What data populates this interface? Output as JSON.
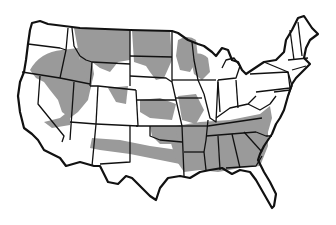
{
  "map": {
    "subject": "Contiguous United States",
    "style": "black-and-white outline map with gray shaded distribution regions",
    "colors": {
      "background": "#ffffff",
      "shade": "#9a9a9a",
      "outline": "#111111"
    },
    "shaded_regions": [
      "Pacific Northwest interior / Great Basin (Oregon, Idaho, Nevada, Utah)",
      "Montana and Wyoming",
      "North Dakota, South Dakota, Minnesota, Wisconsin",
      "Central plains (Nebraska, Kansas, Iowa, Missouri)",
      "Band across Arizona, New Mexico, Texas to Southeast",
      "Southeast (Arkansas, Louisiana, Mississippi, Alabama, Georgia, Tennessee, Kentucky, Carolinas)"
    ]
  }
}
